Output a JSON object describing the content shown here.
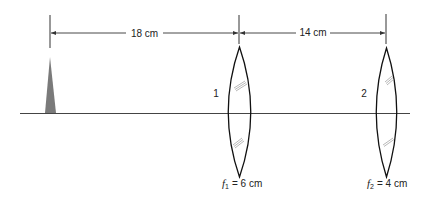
{
  "diagram": {
    "dimensions": [
      {
        "label": "18 cm",
        "from": "object",
        "to": "lens-1"
      },
      {
        "label": "14 cm",
        "from": "lens-1",
        "to": "lens-2"
      }
    ],
    "object": {
      "shape": "triangle",
      "color": "#7a7a7a"
    },
    "lenses": [
      {
        "id": "1",
        "number_label": "1",
        "focal_symbol": "f",
        "focal_subscript": "1",
        "focal_value": "= 6 cm"
      },
      {
        "id": "2",
        "number_label": "2",
        "focal_symbol": "f",
        "focal_subscript": "2",
        "focal_value": "= 4 cm"
      }
    ],
    "colors": {
      "line": "#333333",
      "object": "#7a7a7a",
      "background": "#ffffff"
    }
  }
}
